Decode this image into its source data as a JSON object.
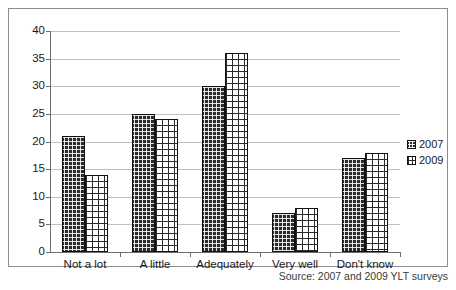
{
  "chart_data": {
    "type": "bar",
    "title": "",
    "subtitle": "",
    "xlabel": "",
    "ylabel": "",
    "categories": [
      "Not a lot",
      "A little",
      "Adequately",
      "Very well",
      "Don't know"
    ],
    "series": [
      {
        "name": "2007",
        "values": [
          21,
          25,
          30,
          7,
          17
        ],
        "color": "#2b2b2b",
        "pattern": "dark-checker"
      },
      {
        "name": "2009",
        "values": [
          14,
          24,
          36,
          8,
          18
        ],
        "color": "#ffffff",
        "pattern": "grid-crosshatch"
      }
    ],
    "ylim": [
      0,
      40
    ],
    "ytick_step": 5,
    "yticks": [
      0,
      5,
      10,
      15,
      20,
      25,
      30,
      35,
      40
    ],
    "ytick_labels": [
      "0",
      "5",
      "10",
      "15",
      "20",
      "25",
      "30",
      "35",
      "40"
    ],
    "grid": true,
    "grid_axis": "y",
    "legend_position": "right",
    "annotations": [
      "Source: 2007 and 2009 YLT surveys"
    ]
  },
  "legend": {
    "entries": [
      {
        "label": "2007",
        "swatch": "series-2007-swatch"
      },
      {
        "label": "2009",
        "swatch": "series-2009-swatch"
      }
    ]
  },
  "caption": {
    "source": "Source: 2007 and 2009 YLT surveys"
  }
}
